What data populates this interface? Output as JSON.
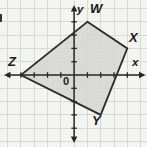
{
  "figure": {
    "type": "coordinate-plane-quadrilateral",
    "background_color": "#f4f4f0",
    "grid": {
      "color": "#d7dbd2",
      "spacing_px": 13.3,
      "origin_px": {
        "x": 74.1,
        "y": 75.0
      }
    },
    "axes": {
      "color": "#262626",
      "x_axis_label": "x",
      "y_axis_label": "y",
      "origin_label": "0",
      "x_extent_px": [
        4,
        145.5
      ],
      "y_extent_px": [
        5,
        143
      ],
      "tick_units": [
        -4,
        -3,
        -2,
        -1,
        1,
        2,
        3,
        4
      ],
      "tick_half_len_px": 2.8
    },
    "polygon": {
      "name": "WXYZ",
      "fill_color": "#d4d5d0",
      "fill_opacity": 0.82,
      "stroke_color": "#2d2d2d",
      "stroke_width": 1.8,
      "vertices": [
        {
          "label": "W",
          "coords": [
            1,
            4
          ]
        },
        {
          "label": "X",
          "coords": [
            4,
            2
          ]
        },
        {
          "label": "Y",
          "coords": [
            2,
            -3
          ]
        },
        {
          "label": "Z",
          "coords": [
            -4,
            0
          ]
        }
      ]
    }
  }
}
